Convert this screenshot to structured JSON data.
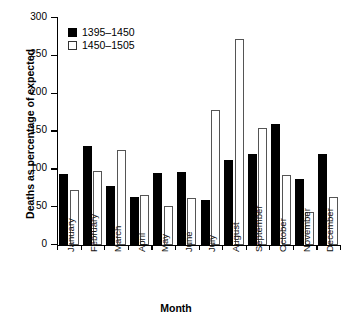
{
  "chart_data": {
    "type": "bar",
    "title": "",
    "xlabel": "Month",
    "ylabel": "Deaths as percentage of expected",
    "categories": [
      "January",
      "February",
      "March",
      "April",
      "May",
      "June",
      "July",
      "August",
      "September",
      "October",
      "November",
      "December"
    ],
    "series": [
      {
        "name": "1395–1450",
        "color": "#000000",
        "values": [
          94,
          131,
          78,
          63,
          95,
          96,
          60,
          112,
          120,
          160,
          87,
          120
        ]
      },
      {
        "name": "1450–1505",
        "color": "#ffffff",
        "values": [
          73,
          98,
          125,
          66,
          52,
          62,
          178,
          272,
          155,
          93,
          44,
          64
        ]
      }
    ],
    "ylim": [
      0,
      300
    ],
    "yticks": [
      0,
      50,
      100,
      150,
      200,
      250,
      300
    ],
    "ytick_labels": [
      "0",
      "50",
      "100",
      "150",
      "200",
      "250",
      "300"
    ],
    "grid": false,
    "legend_position": "top-left"
  },
  "axes": {
    "y_title": "Deaths as percentage of expected",
    "x_title": "Month"
  },
  "legend": {
    "entries": [
      {
        "label": "1395–1450",
        "swatch": "black"
      },
      {
        "label": "1450–1505",
        "swatch": "white"
      }
    ]
  }
}
